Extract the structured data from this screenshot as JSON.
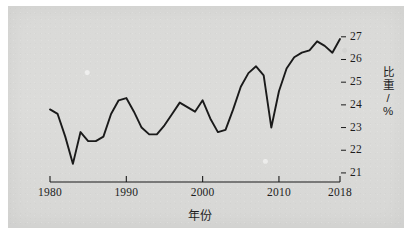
{
  "chart_data": {
    "type": "line",
    "title": "",
    "xlabel": "年份",
    "ylabel": "比重/%",
    "xtick_labels": [
      "1980",
      "1990",
      "2000",
      "2010",
      "2018"
    ],
    "xtick_values": [
      1980,
      1990,
      2000,
      2010,
      2018
    ],
    "ytick_labels": [
      "27",
      "26",
      "25",
      "24",
      "23",
      "22",
      "21"
    ],
    "ytick_values": [
      27,
      26,
      25,
      24,
      23,
      22,
      21
    ],
    "xlim": [
      1980,
      2018
    ],
    "ylim": [
      20.6,
      27.3
    ],
    "grid": false,
    "legend": null,
    "line_color": "#1a1a1a",
    "background_color": "#d9d9d7",
    "x": [
      1980,
      1981,
      1982,
      1983,
      1984,
      1985,
      1986,
      1987,
      1988,
      1989,
      1990,
      1991,
      1992,
      1993,
      1994,
      1995,
      1996,
      1997,
      1998,
      1999,
      2000,
      2001,
      2002,
      2003,
      2004,
      2005,
      2006,
      2007,
      2008,
      2009,
      2010,
      2011,
      2012,
      2013,
      2014,
      2015,
      2016,
      2017,
      2018
    ],
    "values": [
      23.8,
      23.6,
      22.6,
      21.4,
      22.8,
      22.4,
      22.4,
      22.6,
      23.6,
      24.2,
      24.3,
      23.7,
      23.0,
      22.7,
      22.7,
      23.1,
      23.6,
      24.1,
      23.9,
      23.7,
      24.2,
      23.4,
      22.8,
      22.9,
      23.8,
      24.8,
      25.4,
      25.7,
      25.3,
      23.0,
      24.6,
      25.6,
      26.1,
      26.3,
      26.4,
      26.8,
      26.6,
      26.3,
      26.9
    ],
    "series_name": "比重"
  },
  "axis": {
    "x_axis_name": "x-axis",
    "y_axis_name": "y-axis"
  }
}
